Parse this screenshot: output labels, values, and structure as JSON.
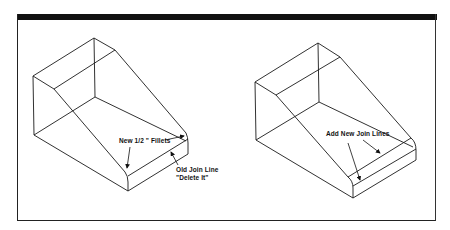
{
  "figure": {
    "panels": [
      {
        "id": "before",
        "annotations": [
          {
            "text": "New 1/2 \" Fillets",
            "x": 119,
            "y": 137
          },
          {
            "text": "Old Join Line",
            "x": 176,
            "y": 168
          },
          {
            "text": "\"Delete It\"",
            "x": 176,
            "y": 176
          }
        ]
      },
      {
        "id": "after",
        "annotations": [
          {
            "text": "Add New Join Lines",
            "x": 326,
            "y": 130
          }
        ]
      }
    ],
    "colors": {
      "line": "#1a1a1a",
      "background": "#ffffff",
      "frame_bar": "#111111"
    }
  }
}
